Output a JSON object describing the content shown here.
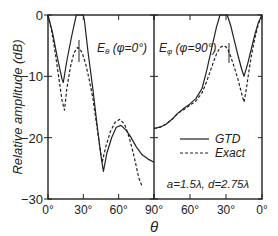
{
  "chart_data": {
    "type": "line",
    "ylabel": "Relative amplitude (dB)",
    "xlabel": "θ",
    "ylim": [
      -30,
      0
    ],
    "yticks": [
      0,
      -10,
      -20,
      -30
    ],
    "ytick_labels": [
      "0",
      "-10",
      "-20",
      "-30"
    ],
    "grid": false,
    "annotation": "a=1.5λ, d=2.75λ",
    "legend": {
      "position": "lower right of right panel",
      "entries": [
        {
          "label": "GTD",
          "style": "solid"
        },
        {
          "label": "Exact",
          "style": "dashed"
        }
      ]
    },
    "panels": [
      {
        "title": "Eθ (φ=0°)",
        "title_main": "E",
        "title_sub": "θ",
        "title_rest": " (φ=0°)",
        "xlim": [
          0,
          90
        ],
        "xticks": [
          0,
          30,
          60,
          90
        ],
        "xtick_labels": [
          "0°",
          "30°",
          "60°",
          "90°"
        ],
        "series": [
          {
            "name": "GTD",
            "style": "solid",
            "x": [
              0,
              4,
              8,
              12,
              13,
              16,
              20,
              24,
              27,
              30,
              31,
              34,
              38,
              42,
              45,
              47,
              50,
              54,
              58,
              62,
              66,
              70,
              75,
              80,
              85,
              90
            ],
            "y": [
              0,
              -3,
              -7,
              -10.5,
              -11,
              -7.5,
              -3.5,
              0,
              0,
              0,
              -1,
              -6,
              -12,
              -18.5,
              -23,
              -25.5,
              -22.5,
              -20,
              -18.3,
              -18,
              -18.7,
              -19.8,
              -21.5,
              -22.8,
              -23.5,
              -24
            ]
          },
          {
            "name": "Exact",
            "style": "dashed",
            "x": [
              0,
              3,
              6,
              9,
              12,
              14,
              16,
              19,
              22,
              25,
              27,
              29,
              32,
              35,
              38,
              41,
              44,
              46,
              49,
              53,
              57,
              61,
              65,
              69,
              73,
              77,
              80
            ],
            "y": [
              0,
              -2.5,
              -6,
              -10,
              -14,
              -15.5,
              -12,
              -8.5,
              -6.2,
              -5.3,
              -5.5,
              -6.2,
              -8,
              -10.5,
              -13.5,
              -17.5,
              -21.5,
              -24,
              -21.5,
              -19,
              -17.5,
              -17,
              -17.8,
              -20,
              -23,
              -26.5,
              -28
            ]
          }
        ]
      },
      {
        "title": "Eφ (φ=90°)",
        "title_main": "E",
        "title_sub": "φ",
        "title_rest": " (φ=90°)",
        "xlim": [
          90,
          0
        ],
        "xticks": [
          90,
          60,
          30,
          0
        ],
        "xtick_labels": [
          "90°",
          "60°",
          "30°",
          "0°"
        ],
        "series": [
          {
            "name": "GTD",
            "style": "solid",
            "x": [
              90,
              85,
              80,
              75,
              70,
              65,
              60,
              55,
              50,
              46,
              42,
              38,
              35,
              33,
              31,
              29,
              26,
              23,
              20,
              17,
              15,
              12,
              9,
              6,
              3,
              0
            ],
            "y": [
              -18.5,
              -18.3,
              -17.8,
              -17,
              -16,
              -15.2,
              -14.5,
              -13.6,
              -12,
              -9,
              -5.5,
              -2,
              0,
              0,
              0,
              0,
              -1.8,
              -4.2,
              -6.6,
              -8.8,
              -10,
              -8,
              -5.6,
              -3.2,
              -1.2,
              0
            ]
          },
          {
            "name": "Exact",
            "style": "dashed",
            "x": [
              90,
              85,
              80,
              75,
              70,
              65,
              60,
              55,
              50,
              46,
              42,
              38,
              35,
              32,
              30,
              28,
              26,
              23,
              20,
              17,
              15,
              13,
              11,
              9,
              6,
              3,
              0
            ],
            "y": [
              -18.5,
              -18.3,
              -17.8,
              -17,
              -16,
              -15.4,
              -14.7,
              -14,
              -12.7,
              -10.8,
              -8.5,
              -6.4,
              -5.3,
              -5,
              -5.2,
              -5.8,
              -6.8,
              -8.6,
              -10.5,
              -12.8,
              -14.2,
              -12,
              -9.3,
              -6.8,
              -3.8,
              -1.5,
              0
            ]
          }
        ]
      }
    ]
  }
}
